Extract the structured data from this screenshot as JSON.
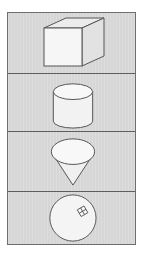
{
  "palette": {
    "title": "",
    "items": [
      {
        "id": "cube",
        "label": "Cube",
        "icon": "cube-icon"
      },
      {
        "id": "cylinder",
        "label": "Cylinder",
        "icon": "cylinder-icon"
      },
      {
        "id": "cone",
        "label": "Cone",
        "icon": "cone-icon"
      },
      {
        "id": "sphere",
        "label": "Sphere",
        "icon": "sphere-icon"
      }
    ]
  },
  "colors": {
    "background": "#d6d6d6",
    "border": "#5e5e5e",
    "shape_fill": "#f4f4f4",
    "shape_stroke": "#555555"
  }
}
